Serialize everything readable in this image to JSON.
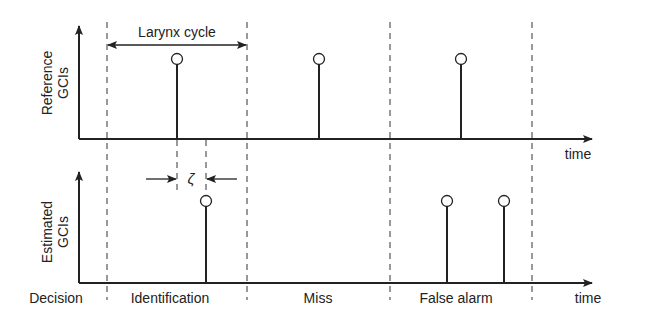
{
  "diagram": {
    "colors": {
      "ink": "#222222",
      "background": "#ffffff"
    },
    "top_panel": {
      "ylabel_line1": "Reference",
      "ylabel_line2": "GCIs",
      "xlabel": "time",
      "span_label": "Larynx cycle",
      "stems": [
        {
          "name": "reference-gci-1"
        },
        {
          "name": "reference-gci-2"
        },
        {
          "name": "reference-gci-3"
        }
      ]
    },
    "bottom_panel": {
      "ylabel_line1": "Estimated",
      "ylabel_line2": "GCIs",
      "xlabel": "time",
      "zeta_label": "ζ",
      "stems": [
        {
          "name": "estimated-gci-1"
        },
        {
          "name": "estimated-gci-2"
        },
        {
          "name": "estimated-gci-3"
        }
      ]
    },
    "decision_row": {
      "title": "Decision",
      "outcomes": [
        "Identification",
        "Miss",
        "False alarm"
      ]
    }
  }
}
